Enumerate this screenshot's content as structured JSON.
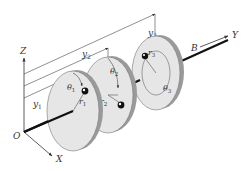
{
  "diagram": {
    "colors": {
      "disk_fill": "#e6e6e6",
      "disk_rim": "#9a9a9a",
      "shaft": "#111111",
      "line": "#333333",
      "background": "#ffffff"
    },
    "axes": {
      "origin": "O",
      "x": "X",
      "y": "Y",
      "z": "Z",
      "bearing": "B"
    },
    "dimensions": [
      {
        "name": "y",
        "sub": "1"
      },
      {
        "name": "y",
        "sub": "2"
      },
      {
        "name": "y",
        "sub": "3"
      }
    ],
    "disks": [
      {
        "id": 1,
        "angle": {
          "name": "θ",
          "sub": "1"
        },
        "radius": {
          "name": "r",
          "sub": "1"
        }
      },
      {
        "id": 2,
        "angle": {
          "name": "θ",
          "sub": "2"
        },
        "radius": {
          "name": "r",
          "sub": "2"
        }
      },
      {
        "id": 3,
        "angle": {
          "name": "θ",
          "sub": "3"
        },
        "radius": {
          "name": "r",
          "sub": "3"
        }
      }
    ]
  }
}
